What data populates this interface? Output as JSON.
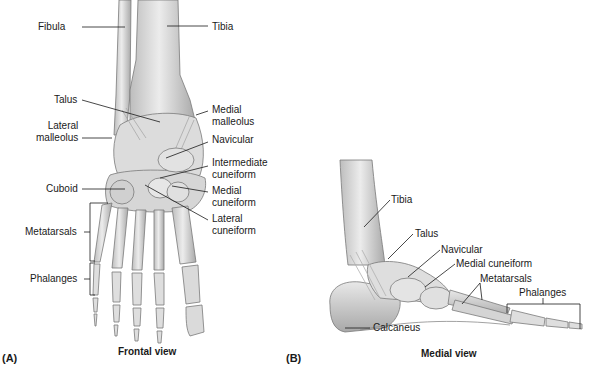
{
  "panels": [
    {
      "tag": "(A)",
      "caption": "Frontal view",
      "labels": {
        "fibula": "Fibula",
        "tibia": "Tibia",
        "talus": "Talus",
        "medial_malleolus": [
          "Medial",
          "malleolus"
        ],
        "lateral_malleolus": [
          "Lateral",
          "malleolus"
        ],
        "navicular": "Navicular",
        "intermediate_cuneiform": [
          "Intermediate",
          "cuneiform"
        ],
        "cuboid": "Cuboid",
        "medial_cuneiform": [
          "Medial",
          "cuneiform"
        ],
        "lateral_cuneiform": [
          "Lateral",
          "cuneiform"
        ],
        "metatarsals": "Metatarsals",
        "phalanges": "Phalanges"
      }
    },
    {
      "tag": "(B)",
      "caption": "Medial view",
      "labels": {
        "tibia": "Tibia",
        "talus": "Talus",
        "navicular": "Navicular",
        "medial_cuneiform": "Medial cuneiform",
        "metatarsals": "Metatarsals",
        "phalanges": "Phalanges",
        "calcaneus": "Calcaneus"
      }
    }
  ],
  "colors": {
    "bone_fill": "#d9d9d9",
    "bone_stroke": "#7a7a7a",
    "ligament": "#b8b8b8",
    "leader_line": "#1a1a1a",
    "text": "#1a1a1a"
  }
}
